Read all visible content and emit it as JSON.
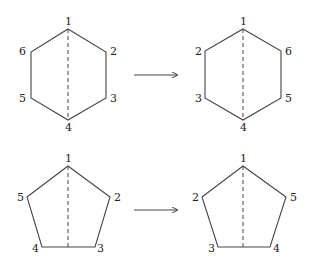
{
  "hexagon_before": {
    "labels": [
      "1",
      "2",
      "3",
      "4",
      "5",
      "6"
    ]
  },
  "hexagon_after": {
    "labels": [
      "1",
      "6",
      "5",
      "4",
      "3",
      "2"
    ]
  },
  "pentagon_before": {
    "labels": [
      "1",
      "2",
      "3",
      "4",
      "5"
    ]
  },
  "pentagon_after": {
    "labels": [
      "1",
      "5",
      "4",
      "3",
      "2"
    ]
  }
}
